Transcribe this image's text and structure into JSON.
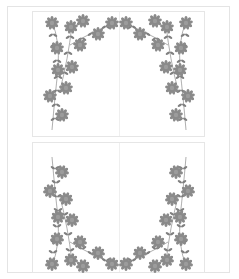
{
  "document": {
    "type": "printable stationery sheet",
    "panels": [
      {
        "id": "top",
        "ornament": "floral-arch",
        "orientation": "arch-up"
      },
      {
        "id": "bottom",
        "ornament": "floral-arch",
        "orientation": "arch-down"
      }
    ]
  },
  "colors": {
    "flower": "#8a8a8a",
    "flower_center": "#9c9c9c",
    "leaf": "#7f7f7f",
    "border": "#e4e4e4",
    "background": "#ffffff"
  }
}
